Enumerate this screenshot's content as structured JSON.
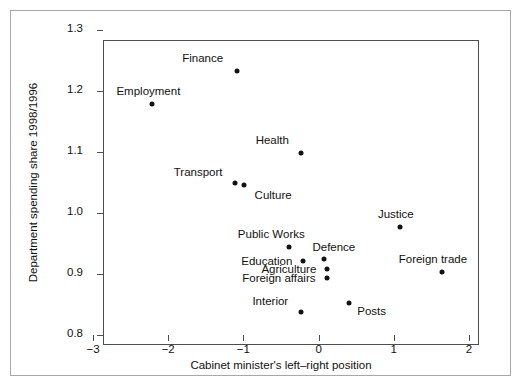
{
  "chart_data": {
    "type": "scatter",
    "title": "",
    "xlabel": "Cabinet minister's left–right position",
    "ylabel": "Department spending share 1998/1996",
    "xlim": [
      -3,
      2
    ],
    "ylim": [
      0.8,
      1.3
    ],
    "xticks": [
      "-3",
      "-2",
      "-1",
      "0",
      "1",
      "2"
    ],
    "xtick_values": [
      -3,
      -2,
      -1,
      0,
      1,
      2
    ],
    "yticks": [
      "1.3",
      "1.2",
      "1.1",
      "1.0",
      "0.9",
      "0.8"
    ],
    "ytick_values": [
      1.3,
      1.2,
      1.1,
      1.0,
      0.9,
      0.8
    ],
    "grid": false,
    "legend": false,
    "points": [
      {
        "label": "Finance",
        "x": -1.09,
        "y": 1.233,
        "label_dx": -34,
        "label_dy": -13
      },
      {
        "label": "Employment",
        "x": -2.21,
        "y": 1.179,
        "label_dx": -4,
        "label_dy": -13
      },
      {
        "label": "Health",
        "x": -0.23,
        "y": 1.098,
        "label_dx": -29,
        "label_dy": -13
      },
      {
        "label": "Transport",
        "x": -1.11,
        "y": 1.049,
        "label_dx": -37,
        "label_dy": -11
      },
      {
        "label": "Culture",
        "x": -0.99,
        "y": 1.046,
        "label_dx": 29,
        "label_dy": 10
      },
      {
        "label": "Justice",
        "x": 1.08,
        "y": 0.977,
        "label_dx": -4,
        "label_dy": -13
      },
      {
        "label": "Public Works",
        "x": -0.39,
        "y": 0.945,
        "label_dx": -18,
        "label_dy": -13
      },
      {
        "label": "Education",
        "x": -0.21,
        "y": 0.922,
        "label_dx": -36,
        "label_dy": 0
      },
      {
        "label": "Defence",
        "x": 0.07,
        "y": 0.925,
        "label_dx": 10,
        "label_dy": -12
      },
      {
        "label": "Agriculture",
        "x": 0.11,
        "y": 0.909,
        "label_dx": -38,
        "label_dy": 0
      },
      {
        "label": "Foreign affairs",
        "x": 0.11,
        "y": 0.894,
        "label_dx": -48,
        "label_dy": 0
      },
      {
        "label": "Foreign trade",
        "x": 1.64,
        "y": 0.903,
        "label_dx": -9,
        "label_dy": -13
      },
      {
        "label": "Posts",
        "x": 0.4,
        "y": 0.852,
        "label_dx": 23,
        "label_dy": 8
      },
      {
        "label": "Interior",
        "x": -0.23,
        "y": 0.838,
        "label_dx": -31,
        "label_dy": -11
      }
    ]
  },
  "colors": {
    "marker": "#121212",
    "axis": "#4d4d4d",
    "text": "#111111",
    "outer_border": "#a8a8a8",
    "background": "#ffffff"
  }
}
